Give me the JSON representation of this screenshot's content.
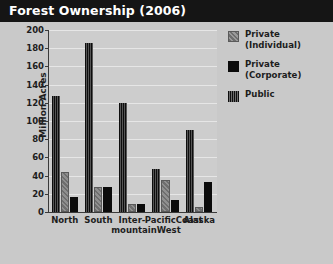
{
  "header": {
    "title": "Forest Ownership (2006)"
  },
  "footnote": {
    "text": "Data source: USDA Forest Service. Coverage: all 50 states; see p. 357 for"
  },
  "legend": {
    "position": "right",
    "items": [
      {
        "label_line1": "Private",
        "label_line2": "(Individual)",
        "pattern": "diagonal-hatch",
        "color": "#7d7d7d"
      },
      {
        "label_line1": "Private",
        "label_line2": "(Corporate)",
        "pattern": "solid",
        "color": "#0b0b0b"
      },
      {
        "label_line1": "Public",
        "label_line2": "",
        "pattern": "vertical-stripe",
        "color": "#111111"
      }
    ]
  },
  "chart_data": {
    "type": "bar",
    "title": "Forest Ownership (2006)",
    "xlabel": "",
    "ylabel": "Million Acres",
    "ylim": [
      0,
      200
    ],
    "yticks": [
      0,
      20,
      40,
      60,
      80,
      100,
      120,
      140,
      160,
      180,
      200
    ],
    "ytick_labels": [
      "0",
      "20",
      "40",
      "60",
      "80",
      "100",
      "120",
      "140",
      "160",
      "180",
      "200"
    ],
    "grid": true,
    "legend_position": "right",
    "categories": [
      "North",
      "South",
      "Inter-mountain West",
      "Pacific Coast",
      "Alaska"
    ],
    "category_labels": [
      [
        "North",
        ""
      ],
      [
        "South",
        ""
      ],
      [
        "Inter-",
        "mountain",
        "West"
      ],
      [
        "Pacific",
        "Coast"
      ],
      [
        "Alaska",
        ""
      ]
    ],
    "series": [
      {
        "name": "Private (Individual)",
        "values": [
          44,
          27,
          9,
          35,
          5
        ]
      },
      {
        "name": "Private (Corporate)",
        "values": [
          16,
          27,
          9,
          13,
          33
        ]
      },
      {
        "name": "Public",
        "values": [
          127,
          186,
          120,
          47,
          90
        ]
      }
    ],
    "bar_order": [
      "Public",
      "Private (Individual)",
      "Private (Corporate)"
    ]
  }
}
